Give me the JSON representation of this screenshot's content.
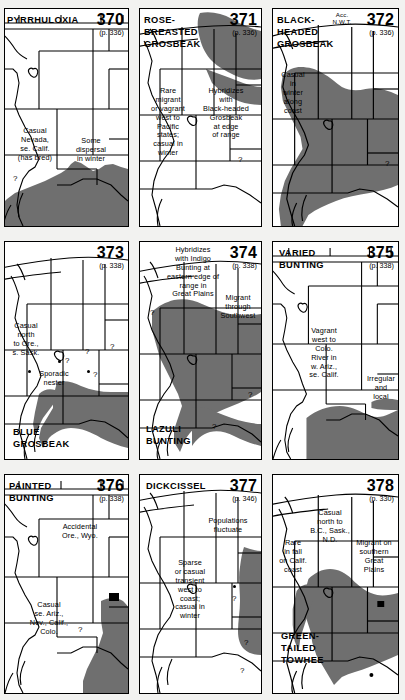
{
  "page": {
    "kind": "field-guide-range-map-plate",
    "columns": 3,
    "rows": 3,
    "background_color": "#f2f2f0",
    "range_fill_color": "#6f6f6f",
    "ink_color": "#000000",
    "paper_color": "#ffffff"
  },
  "maps": [
    {
      "id": "map-370",
      "number": "370",
      "page_ref": "(p. 336)",
      "species": "PYRRHULOXIA",
      "annotations": [
        {
          "text": "Casual\nNevada,\nse. Calif.\n(has bred)"
        },
        {
          "text": "Some\ndispersal\nin winter"
        }
      ],
      "question_marks": 1
    },
    {
      "id": "map-371",
      "number": "371",
      "page_ref": "(p. 336)",
      "species": "ROSE-\nBREASTED\nGROSBEAK",
      "annotations": [
        {
          "text": "Rare\nmigrant\nor vagrant\nwest to\nPacific\nstates;\ncasual in\nwinter"
        },
        {
          "text": "Hybridizes\nwith\nBlack-headed\nGrosbeak\nat edge\nof range"
        }
      ],
      "question_marks": 1
    },
    {
      "id": "map-372",
      "number": "372",
      "page_ref": "(p. 336)",
      "species": "BLACK-\nHEADED\nGROSBEAK",
      "annotations": [
        {
          "text": "Acc.\nN.W.T."
        },
        {
          "text": "Casual\nin\nwinter\nalong\ncoast"
        }
      ],
      "question_marks": 1
    },
    {
      "id": "map-373",
      "number": "373",
      "page_ref": "(p. 338)",
      "species": "BLUE\nGROSBEAK",
      "annotations": [
        {
          "text": "Casual\nnorth\nto Ore.,\ns. Sask."
        },
        {
          "text": "Sporadic\nnester"
        }
      ],
      "question_marks": 4
    },
    {
      "id": "map-374",
      "number": "374",
      "page_ref": "(p. 338)",
      "species": "LAZULI\nBUNTING",
      "annotations": [
        {
          "text": "Hybridizes\nwith Indigo\nBunting at\neastern edge of\nrange in\nGreat Plains"
        },
        {
          "text": "Migrant\nthrough\nSouthwest"
        }
      ],
      "question_marks": 3
    },
    {
      "id": "map-375",
      "number": "375",
      "page_ref": "(p. 338)",
      "species": "VARIED\nBUNTING",
      "annotations": [
        {
          "text": "Vagrant\nwest to\nColo.\nRiver in\nw. Ariz.,\nse. Calif."
        },
        {
          "text": "Irregular\nand\nlocal"
        }
      ],
      "question_marks": 0
    },
    {
      "id": "map-376",
      "number": "376",
      "page_ref": "(p. 338)",
      "species": "PAINTED\nBUNTING",
      "annotations": [
        {
          "text": "Accidental\nOre., Wyo."
        },
        {
          "text": "Casual\nse. Ariz.,\nNev., Calif.,\nColo."
        }
      ],
      "question_marks": 1
    },
    {
      "id": "map-377",
      "number": "377",
      "page_ref": "(p. 346)",
      "species": "DICKCISSEL",
      "annotations": [
        {
          "text": "Populations\nfluctuate"
        },
        {
          "text": "Sparse\nor casual\ntransient\nwest to\ncoast;\ncasual in\nwinter"
        }
      ],
      "question_marks": 3
    },
    {
      "id": "map-378",
      "number": "378",
      "page_ref": "(p. 330)",
      "species": "GREEN-\nTAILED\nTOWHEE",
      "annotations": [
        {
          "text": "Casual\nnorth to\nB.C., Sask.,\nN.D."
        },
        {
          "text": "Migrant on\nsouthern\nGreat\nPlains"
        },
        {
          "text": "Rare\nin fall\non Calif.\ncoast"
        }
      ],
      "question_marks": 0
    }
  ]
}
